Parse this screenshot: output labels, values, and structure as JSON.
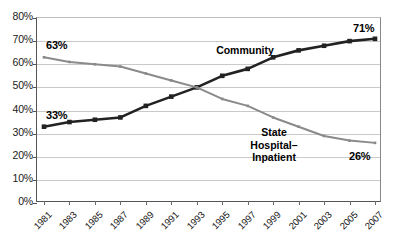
{
  "chart_data": {
    "type": "line",
    "title": "",
    "subtitle": "",
    "xlabel": "",
    "ylabel": "",
    "ylim": [
      0,
      80
    ],
    "ytick_labels": [
      "80%",
      "70%",
      "60%",
      "50%",
      "40%",
      "30%",
      "20%",
      "10%",
      "0%"
    ],
    "ytick_values": [
      80,
      70,
      60,
      50,
      40,
      30,
      20,
      10,
      0
    ],
    "grid": true,
    "legend_position": "inline-annotations",
    "categories": [
      "1981",
      "1983",
      "1985",
      "1987",
      "1989",
      "1991",
      "1993",
      "1995",
      "1997",
      "1999",
      "2001",
      "2003",
      "2005",
      "2007"
    ],
    "x": [
      1981,
      1983,
      1985,
      1987,
      1989,
      1991,
      1993,
      1995,
      1997,
      1999,
      2001,
      2003,
      2005,
      2007
    ],
    "series": [
      {
        "name": "Community",
        "color": "#222222",
        "marker": "square",
        "values": [
          33,
          35,
          36,
          37,
          42,
          46,
          50,
          55,
          58,
          63,
          66,
          68,
          70,
          71
        ]
      },
      {
        "name": "State Hospital–Inpatient",
        "color": "#8a8a8a",
        "marker": "small-square",
        "values": [
          63,
          61,
          60,
          59,
          56,
          53,
          50,
          45,
          42,
          37,
          33,
          29,
          27,
          26
        ]
      }
    ],
    "annotations": [
      {
        "name": "community-start-value",
        "text": "33%",
        "x": 1981,
        "y": 33
      },
      {
        "name": "community-end-value",
        "text": "71%",
        "x": 2007,
        "y": 71
      },
      {
        "name": "state-hospital-start-value",
        "text": "63%",
        "x": 1981,
        "y": 63
      },
      {
        "name": "state-hospital-end-value",
        "text": "26%",
        "x": 2007,
        "y": 26
      },
      {
        "name": "community-series-label",
        "text": "Community"
      },
      {
        "name": "state-hospital-series-label",
        "text": "State\nHospital–\nInpatient"
      }
    ]
  },
  "labels": {
    "community_series": "Community",
    "state_line1": "State",
    "state_line2": "Hospital–",
    "state_line3": "Inpatient",
    "community_start": "33%",
    "community_end": "71%",
    "state_start": "63%",
    "state_end": "26%"
  }
}
